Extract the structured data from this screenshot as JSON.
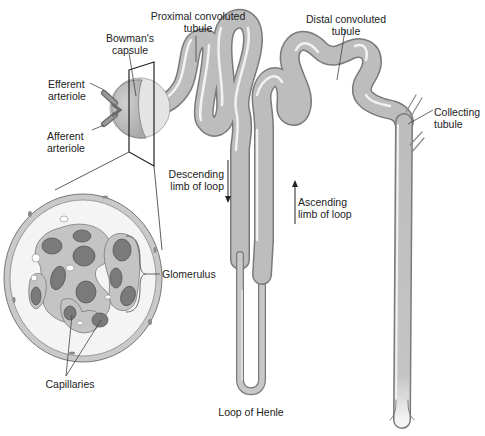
{
  "diagram": {
    "colors": {
      "tubule_fill": "#bdbdbd",
      "tubule_edge": "#7a7a7a",
      "tubule_highlight": "#f2f2f2",
      "capillary_dark": "#6f6f6f",
      "capillary_mid": "#9a9a9a",
      "tissue": "#c9c9c9",
      "background": "#ffffff"
    },
    "labels": {
      "proximal": [
        "Proximal convoluted",
        "tubule"
      ],
      "distal": [
        "Distal convoluted",
        "tubule"
      ],
      "bowmans": [
        "Bowman's",
        "capsule"
      ],
      "efferent": [
        "Efferent",
        "arteriole"
      ],
      "afferent": [
        "Afferent",
        "arteriole"
      ],
      "collecting": [
        "Collecting",
        "tubule"
      ],
      "descending": [
        "Descending",
        "limb of loop"
      ],
      "ascending": [
        "Ascending",
        "limb of loop"
      ],
      "glomerulus": "Glomerulus",
      "capillaries": "Capillaries",
      "loop_of_henle": "Loop of Henle"
    },
    "arrows": {
      "descending": "down",
      "ascending": "up"
    }
  }
}
